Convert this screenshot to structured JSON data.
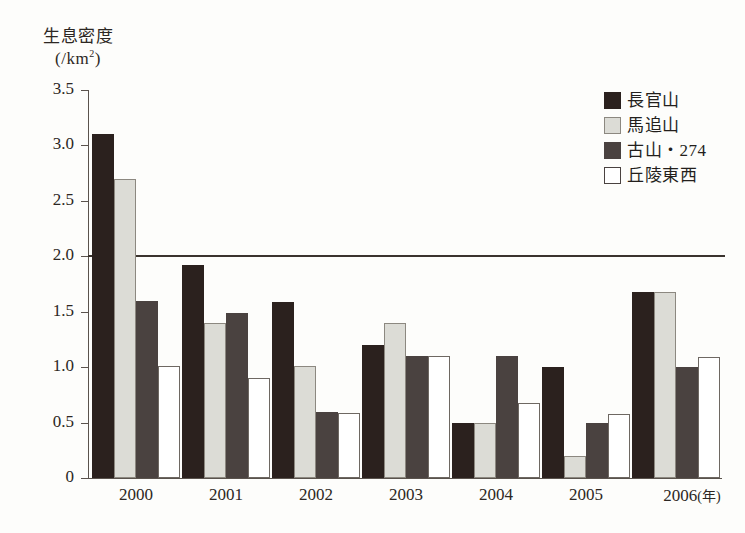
{
  "chart_data": {
    "type": "bar",
    "title": "",
    "ylabel_line1": "生息密度",
    "ylabel_line2_pre": "(/km",
    "ylabel_line2_sup": "2",
    "ylabel_line2_post": ")",
    "xlabel": "",
    "x_unit": "(年)",
    "categories": [
      "2000",
      "2001",
      "2002",
      "2003",
      "2004",
      "2005",
      "2006"
    ],
    "ylim": [
      0,
      3.5
    ],
    "ytick_labels": [
      "0",
      "0.5",
      "1.0",
      "1.5",
      "2.0",
      "2.5",
      "3.0",
      "3.5"
    ],
    "ytick_values": [
      0,
      0.5,
      1.0,
      1.5,
      2.0,
      2.5,
      3.0,
      3.5
    ],
    "grid": false,
    "legend_position": "top-right",
    "reference_line": {
      "value": 2.0,
      "label": "",
      "color": "#3a332e"
    },
    "series": [
      {
        "name": "長官山",
        "color": "#2b211e",
        "values": [
          3.1,
          1.92,
          1.59,
          1.2,
          0.5,
          1.0,
          1.68
        ]
      },
      {
        "name": "馬追山",
        "color": "#dcdcd6",
        "values": [
          2.7,
          1.4,
          1.01,
          1.4,
          0.5,
          0.2,
          1.68
        ]
      },
      {
        "name": "古山・274",
        "color": "#4a4240",
        "values": [
          1.6,
          1.49,
          0.6,
          1.1,
          1.1,
          0.5,
          1.0
        ]
      },
      {
        "name": "丘陵東西",
        "color": "#ffffff",
        "values": [
          1.01,
          0.9,
          0.59,
          1.1,
          0.68,
          0.58,
          1.09
        ]
      }
    ]
  }
}
